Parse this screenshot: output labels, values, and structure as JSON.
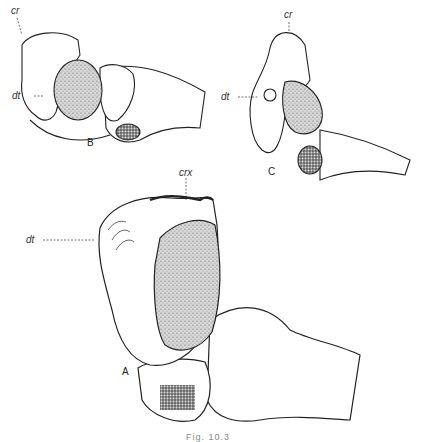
{
  "figure": {
    "caption": "Fig. 10.3",
    "panels": [
      {
        "id": "B",
        "label": "B",
        "annotations": [
          "cr",
          "dt"
        ]
      },
      {
        "id": "C",
        "label": "C",
        "annotations": [
          "cr",
          "dt"
        ]
      },
      {
        "id": "A",
        "label": "A",
        "annotations": [
          "crx",
          "dt"
        ]
      }
    ]
  },
  "labels": {
    "b_cr": "cr",
    "b_dt": "dt",
    "c_cr": "cr",
    "c_dt": "dt",
    "a_crx": "crx",
    "a_dt": "dt",
    "panel_a": "A",
    "panel_b": "B",
    "panel_c": "C"
  }
}
